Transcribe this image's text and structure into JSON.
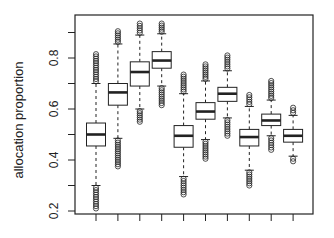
{
  "chart_data": {
    "type": "boxplot",
    "title": "",
    "xlabel": "",
    "ylabel": "allocation proportion",
    "ylim": [
      0.18,
      0.98
    ],
    "yticks": [
      0.2,
      0.3,
      0.4,
      0.5,
      0.6,
      0.7,
      0.8,
      0.9
    ],
    "ytick_labels": [
      "0.2",
      "",
      "0.4",
      "",
      "0.6",
      "",
      "0.8",
      ""
    ],
    "grid": false,
    "legend": null,
    "categories": [
      "1",
      "2",
      "3",
      "4",
      "5",
      "6",
      "7",
      "8",
      "9",
      "10"
    ],
    "xtick_labels_visible": false,
    "boxes": [
      {
        "q1": 0.455,
        "median": 0.5,
        "q3": 0.545,
        "whisker_low": 0.3,
        "whisker_high": 0.7,
        "outlier_low_min": 0.21,
        "outlier_high_max": 0.815
      },
      {
        "q1": 0.615,
        "median": 0.665,
        "q3": 0.7,
        "whisker_low": 0.485,
        "whisker_high": 0.855,
        "outlier_low_min": 0.375,
        "outlier_high_max": 0.905
      },
      {
        "q1": 0.69,
        "median": 0.745,
        "q3": 0.785,
        "whisker_low": 0.6,
        "whisker_high": 0.89,
        "outlier_low_min": 0.55,
        "outlier_high_max": 0.935
      },
      {
        "q1": 0.76,
        "median": 0.79,
        "q3": 0.825,
        "whisker_low": 0.69,
        "whisker_high": 0.895,
        "outlier_low_min": 0.615,
        "outlier_high_max": 0.935
      },
      {
        "q1": 0.45,
        "median": 0.495,
        "q3": 0.535,
        "whisker_low": 0.335,
        "whisker_high": 0.66,
        "outlier_low_min": 0.265,
        "outlier_high_max": 0.735
      },
      {
        "q1": 0.56,
        "median": 0.59,
        "q3": 0.625,
        "whisker_low": 0.48,
        "whisker_high": 0.71,
        "outlier_low_min": 0.405,
        "outlier_high_max": 0.775
      },
      {
        "q1": 0.63,
        "median": 0.66,
        "q3": 0.685,
        "whisker_low": 0.565,
        "whisker_high": 0.75,
        "outlier_low_min": 0.495,
        "outlier_high_max": 0.81
      },
      {
        "q1": 0.455,
        "median": 0.49,
        "q3": 0.52,
        "whisker_low": 0.36,
        "whisker_high": 0.61,
        "outlier_low_min": 0.3,
        "outlier_high_max": 0.655
      },
      {
        "q1": 0.535,
        "median": 0.555,
        "q3": 0.58,
        "whisker_low": 0.495,
        "whisker_high": 0.635,
        "outlier_low_min": 0.44,
        "outlier_high_max": 0.71
      },
      {
        "q1": 0.47,
        "median": 0.495,
        "q3": 0.52,
        "whisker_low": 0.415,
        "whisker_high": 0.575,
        "outlier_low_min": 0.395,
        "outlier_high_max": 0.605
      }
    ]
  },
  "colors": {
    "stroke": "#222222",
    "box_fill": "#ffffff",
    "background": "#ffffff"
  }
}
